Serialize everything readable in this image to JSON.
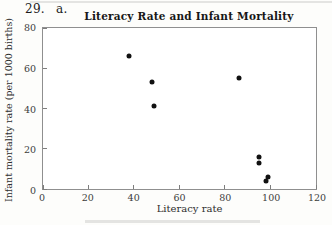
{
  "page": {
    "exercise_number": "29.",
    "part_label": "a."
  },
  "chart_data": {
    "type": "scatter",
    "title": "Literacy Rate and Infant Mortality",
    "xlabel": "Literacy rate",
    "ylabel": "Infant mortality rate (per 1000 births)",
    "xlim": [
      0,
      120
    ],
    "ylim": [
      0,
      80
    ],
    "x_ticks": [
      0,
      20,
      40,
      60,
      80,
      100,
      120
    ],
    "y_ticks": [
      0,
      20,
      40,
      60,
      80
    ],
    "grid": false,
    "legend": "none",
    "marker": {
      "shape": "circle",
      "color": "#111111",
      "diameter_px": 5
    },
    "points": [
      {
        "x": 38,
        "y": 66
      },
      {
        "x": 48,
        "y": 53
      },
      {
        "x": 49,
        "y": 41
      },
      {
        "x": 86,
        "y": 55
      },
      {
        "x": 95,
        "y": 16
      },
      {
        "x": 95,
        "y": 13
      },
      {
        "x": 99,
        "y": 6
      },
      {
        "x": 98,
        "y": 4
      }
    ]
  },
  "colors": {
    "background": "#fdfdfb",
    "plot_background": "#ffffff",
    "axis_frame": "#8f8f8f",
    "text": "#1b1b1b",
    "tick_label": "#3c3c3c",
    "point": "#111111"
  }
}
